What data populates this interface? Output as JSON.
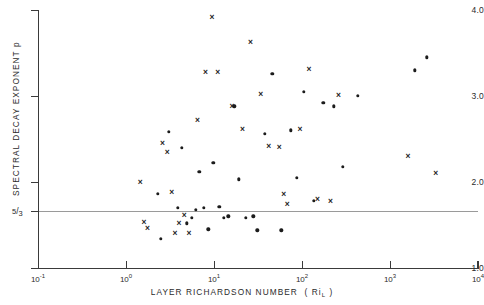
{
  "chart_data": {
    "type": "scatter",
    "title": "",
    "xlabel": "LAYER RICHARDSON NUMBER  ( Ri_L )",
    "ylabel": "SPECTRAL DECAY EXPONENT  p",
    "xscale": "log",
    "yscale": "linear",
    "xlim": [
      0.1,
      10000
    ],
    "ylim": [
      1.0,
      4.0
    ],
    "grid": false,
    "legend": "none",
    "x_tick_labels": [
      "10⁻¹",
      "10⁰",
      "10¹",
      "10²",
      "10³",
      "10⁴"
    ],
    "x_tick_values": [
      0.1,
      1,
      10,
      100,
      1000,
      10000
    ],
    "y_tick_labels": [
      "4.0",
      "3.0",
      "2.0",
      "1.0"
    ],
    "y_tick_values": [
      4.0,
      3.0,
      2.0,
      1.0
    ],
    "annotations": [
      {
        "name": "five-thirds-reference-line",
        "type": "hline",
        "y": 1.667,
        "label": "5/3",
        "label_numerator": "5",
        "label_denominator": "3",
        "color": "#9a9a9a"
      }
    ],
    "series": [
      {
        "name": "cross-markers",
        "marker": "x",
        "color": "#1c1c1c",
        "points": [
          {
            "x": 1.45,
            "y": 2.0
          },
          {
            "x": 1.6,
            "y": 1.54
          },
          {
            "x": 1.75,
            "y": 1.47
          },
          {
            "x": 2.6,
            "y": 2.45
          },
          {
            "x": 2.95,
            "y": 2.35
          },
          {
            "x": 3.3,
            "y": 1.88
          },
          {
            "x": 3.6,
            "y": 1.41
          },
          {
            "x": 4.0,
            "y": 1.52
          },
          {
            "x": 4.6,
            "y": 1.62
          },
          {
            "x": 5.2,
            "y": 1.41
          },
          {
            "x": 6.5,
            "y": 2.72
          },
          {
            "x": 8.0,
            "y": 3.28
          },
          {
            "x": 9.5,
            "y": 3.92
          },
          {
            "x": 11.0,
            "y": 3.28
          },
          {
            "x": 16.0,
            "y": 2.88
          },
          {
            "x": 21.0,
            "y": 2.62
          },
          {
            "x": 26.0,
            "y": 3.63
          },
          {
            "x": 34.0,
            "y": 3.02
          },
          {
            "x": 42.0,
            "y": 2.42
          },
          {
            "x": 55.0,
            "y": 2.41
          },
          {
            "x": 62.0,
            "y": 1.86
          },
          {
            "x": 68.0,
            "y": 1.74
          },
          {
            "x": 95.0,
            "y": 2.62
          },
          {
            "x": 120.0,
            "y": 3.31
          },
          {
            "x": 150.0,
            "y": 1.8
          },
          {
            "x": 210.0,
            "y": 1.78
          },
          {
            "x": 260.0,
            "y": 3.01
          },
          {
            "x": 1600.0,
            "y": 2.3
          },
          {
            "x": 3300.0,
            "y": 2.11
          }
        ]
      },
      {
        "name": "dot-markers",
        "marker": "o",
        "color": "#1c1c1c",
        "points": [
          {
            "x": 2.3,
            "y": 1.86
          },
          {
            "x": 2.5,
            "y": 1.34
          },
          {
            "x": 3.05,
            "y": 2.58
          },
          {
            "x": 3.9,
            "y": 1.7
          },
          {
            "x": 4.3,
            "y": 2.4
          },
          {
            "x": 4.9,
            "y": 1.52
          },
          {
            "x": 5.6,
            "y": 1.58
          },
          {
            "x": 6.2,
            "y": 1.68
          },
          {
            "x": 6.8,
            "y": 2.12
          },
          {
            "x": 7.6,
            "y": 1.7
          },
          {
            "x": 8.6,
            "y": 1.45
          },
          {
            "x": 9.8,
            "y": 2.22
          },
          {
            "x": 11.5,
            "y": 1.71
          },
          {
            "x": 13.0,
            "y": 1.58
          },
          {
            "x": 14.5,
            "y": 1.6
          },
          {
            "x": 17.0,
            "y": 2.88
          },
          {
            "x": 19.0,
            "y": 2.03
          },
          {
            "x": 23.0,
            "y": 1.58
          },
          {
            "x": 28.0,
            "y": 1.6
          },
          {
            "x": 31.0,
            "y": 1.44
          },
          {
            "x": 38.0,
            "y": 2.56
          },
          {
            "x": 46.0,
            "y": 3.26
          },
          {
            "x": 58.0,
            "y": 1.44
          },
          {
            "x": 75.0,
            "y": 2.6
          },
          {
            "x": 88.0,
            "y": 2.05
          },
          {
            "x": 105.0,
            "y": 3.05
          },
          {
            "x": 135.0,
            "y": 1.78
          },
          {
            "x": 175.0,
            "y": 2.92
          },
          {
            "x": 230.0,
            "y": 2.88
          },
          {
            "x": 290.0,
            "y": 2.18
          },
          {
            "x": 430.0,
            "y": 3.0
          },
          {
            "x": 1900.0,
            "y": 3.3
          },
          {
            "x": 2600.0,
            "y": 3.45
          }
        ]
      }
    ]
  }
}
